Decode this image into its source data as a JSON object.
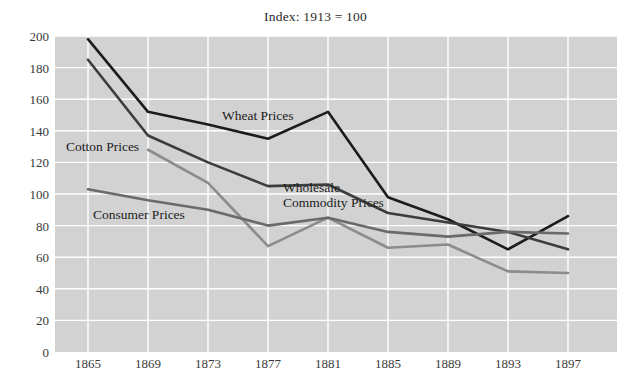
{
  "chart_data": {
    "type": "line",
    "title": "Index: 1913 = 100",
    "xlabel": "",
    "ylabel": "",
    "x": [
      1865,
      1869,
      1873,
      1877,
      1881,
      1885,
      1889,
      1893,
      1897
    ],
    "xticklabels": [
      "1865",
      "1869",
      "1873",
      "1877",
      "1881",
      "1885",
      "1889",
      "1893",
      "1897"
    ],
    "yticklabels": [
      "0",
      "20",
      "40",
      "60",
      "80",
      "100",
      "120",
      "140",
      "160",
      "180",
      "200"
    ],
    "yticks": [
      0,
      20,
      40,
      60,
      80,
      100,
      120,
      140,
      160,
      180,
      200
    ],
    "xlim": [
      1863,
      1899
    ],
    "ylim": [
      0,
      200
    ],
    "grid": true,
    "legend": "inline-annotations",
    "plot_background": "#d2d2d2",
    "gridline_color": "#ffffff",
    "series": [
      {
        "name": "Wheat Prices",
        "color": "#1c1c1c",
        "width": 2.6,
        "values": [
          198,
          152,
          144,
          135,
          152,
          98,
          84,
          65,
          86
        ]
      },
      {
        "name": "Wholesale Commodity Prices",
        "color": "#3c3c3c",
        "width": 2.6,
        "values": [
          185,
          137,
          120,
          105,
          106,
          88,
          82,
          76,
          65
        ]
      },
      {
        "name": "Cotton Prices",
        "color": "#8c8c8c",
        "width": 2.6,
        "values": [
          null,
          128,
          107,
          67,
          85,
          66,
          68,
          51,
          50
        ]
      },
      {
        "name": "Consumer Prices",
        "color": "#6a6a6a",
        "width": 2.6,
        "values": [
          103,
          96,
          90,
          80,
          85,
          76,
          73,
          76,
          75
        ]
      }
    ],
    "annotations": [
      {
        "text": "Wheat Prices",
        "x_px": 222,
        "y_px": 108,
        "align": "left"
      },
      {
        "text": "Wholesale\nCommodity Prices",
        "x_px": 283,
        "y_px": 180,
        "align": "left"
      },
      {
        "text": "Cotton Prices",
        "x_px": 66,
        "y_px": 139,
        "align": "left"
      },
      {
        "text": "Consumer Prices",
        "x_px": 93,
        "y_px": 207,
        "align": "left"
      }
    ]
  }
}
